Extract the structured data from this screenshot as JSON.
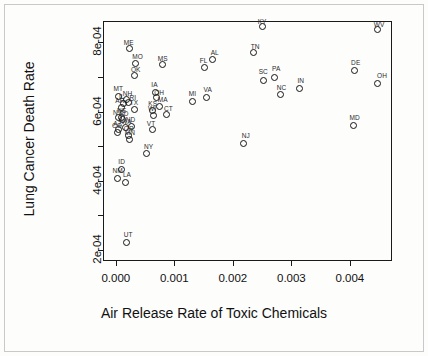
{
  "chart_data": {
    "type": "scatter",
    "title": "",
    "xlabel": "Air Release Rate of Toxic Chemicals",
    "ylabel": "Lung Cancer Death Rate",
    "xlim": [
      -0.00022,
      0.00472
    ],
    "ylim": [
      0.000168,
      0.000862
    ],
    "xticks": [
      0.0,
      0.001,
      0.002,
      0.003,
      0.004
    ],
    "xticklabels": [
      "0.000",
      "0.001",
      "0.002",
      "0.003",
      "0.004"
    ],
    "yticks": [
      0.0002,
      0.0004,
      0.0006,
      0.0008
    ],
    "yticklabels": [
      "2e-04",
      "4e-04",
      "6e-04",
      "8e-04"
    ],
    "grid": false,
    "legend": null,
    "marker": "open-circle",
    "point_label_field": "label",
    "points": [
      {
        "label": "KY",
        "x": 0.0025,
        "y": 0.000845,
        "lx": 0.0025,
        "ly": 0.000862
      },
      {
        "label": "WV",
        "x": 0.00447,
        "y": 0.000836,
        "lx": 0.0045,
        "ly": 0.000853
      },
      {
        "label": "ME",
        "x": 0.00024,
        "y": 0.000782,
        "lx": 0.00022,
        "ly": 0.0008
      },
      {
        "label": "TN",
        "x": 0.00236,
        "y": 0.000771,
        "lx": 0.00238,
        "ly": 0.000789
      },
      {
        "label": "AL",
        "x": 0.00166,
        "y": 0.000751,
        "lx": 0.00169,
        "ly": 0.000772
      },
      {
        "label": "MO",
        "x": 0.00034,
        "y": 0.00074,
        "lx": 0.00037,
        "ly": 0.000762
      },
      {
        "label": "MS",
        "x": 0.00079,
        "y": 0.000735,
        "lx": 0.0008,
        "ly": 0.000756
      },
      {
        "label": "FL",
        "x": 0.00152,
        "y": 0.000727,
        "lx": 0.0015,
        "ly": 0.000749
      },
      {
        "label": "DE",
        "x": 0.00408,
        "y": 0.00072,
        "lx": 0.0041,
        "ly": 0.000742
      },
      {
        "label": "OK",
        "x": 0.00031,
        "y": 0.000703,
        "lx": 0.00034,
        "ly": 0.000723
      },
      {
        "label": "PA",
        "x": 0.00272,
        "y": 0.0007,
        "lx": 0.00274,
        "ly": 0.000725
      },
      {
        "label": "SC",
        "x": 0.00253,
        "y": 0.00069,
        "lx": 0.00252,
        "ly": 0.000716
      },
      {
        "label": "OH",
        "x": 0.00448,
        "y": 0.000681,
        "lx": 0.00455,
        "ly": 0.000706
      },
      {
        "label": "IN",
        "x": 0.00314,
        "y": 0.000668,
        "lx": 0.00316,
        "ly": 0.000692
      },
      {
        "label": "IA",
        "x": 0.00067,
        "y": 0.000655,
        "lx": 0.00066,
        "ly": 0.00068
      },
      {
        "label": "NC",
        "x": 0.00282,
        "y": 0.000649,
        "lx": 0.00283,
        "ly": 0.000671
      },
      {
        "label": "MT",
        "x": 4e-05,
        "y": 0.000645,
        "lx": 4e-05,
        "ly": 0.000669
      },
      {
        "label": "VA",
        "x": 0.00155,
        "y": 0.000641,
        "lx": 0.00157,
        "ly": 0.000665
      },
      {
        "label": "OH2",
        "x": 0.0007,
        "y": 0.000641,
        "lx": 0.00074,
        "ly": 0.000657
      },
      {
        "label": "MI",
        "x": 0.00131,
        "y": 0.00063,
        "lx": 0.00131,
        "ly": 0.000654
      },
      {
        "label": "NH",
        "x": 0.00018,
        "y": 0.000634,
        "lx": 0.0002,
        "ly": 0.000654
      },
      {
        "label": "RI",
        "x": 0.00021,
        "y": 0.000625,
        "lx": 0.00029,
        "ly": 0.000643
      },
      {
        "label": "IL",
        "x": 0.00013,
        "y": 0.000623,
        "lx": 0.0001,
        "ly": 0.000644
      },
      {
        "label": "MA",
        "x": 0.00075,
        "y": 0.000614,
        "lx": 0.0008,
        "ly": 0.000637
      },
      {
        "label": "AR",
        "x": 0.0001,
        "y": 0.000613,
        "lx": 7e-05,
        "ly": 0.000634
      },
      {
        "label": "TX",
        "x": 0.00031,
        "y": 0.000607,
        "lx": 0.00031,
        "ly": 0.000628
      },
      {
        "label": "KS",
        "x": 0.00063,
        "y": 0.000604,
        "lx": 0.00063,
        "ly": 0.000625
      },
      {
        "label": "WI",
        "x": 0.00064,
        "y": 0.00059,
        "lx": 0.00062,
        "ly": 0.00061
      },
      {
        "label": "CT",
        "x": 0.00087,
        "y": 0.000591,
        "lx": 0.0009,
        "ly": 0.000611
      },
      {
        "label": "NE",
        "x": 9e-05,
        "y": 0.000584,
        "lx": 0.0001,
        "ly": 0.000604
      },
      {
        "label": "NV",
        "x": 5e-05,
        "y": 0.000582,
        "lx": 3e-05,
        "ly": 0.0006
      },
      {
        "label": "SD",
        "x": 0.00012,
        "y": 0.000576,
        "lx": 0.00014,
        "ly": 0.000597
      },
      {
        "label": "MD",
        "x": 0.00407,
        "y": 0.000561,
        "lx": 0.00408,
        "ly": 0.000585
      },
      {
        "label": "ND",
        "x": 0.00026,
        "y": 0.000558,
        "lx": 0.00025,
        "ly": 0.00058
      },
      {
        "label": "WA",
        "x": 0.00016,
        "y": 0.000553,
        "lx": 0.00018,
        "ly": 0.000574
      },
      {
        "label": "AZ",
        "x": 5e-05,
        "y": 0.000548,
        "lx": 3e-05,
        "ly": 0.000568
      },
      {
        "label": "VT",
        "x": 0.00062,
        "y": 0.000547,
        "lx": 0.0006,
        "ly": 0.000568
      },
      {
        "label": "CO",
        "x": 3e-05,
        "y": 0.000541,
        "lx": 2e-05,
        "ly": 0.000562
      },
      {
        "label": "OR",
        "x": 0.00021,
        "y": 0.000531,
        "lx": 0.00022,
        "ly": 0.000552
      },
      {
        "label": "MN",
        "x": 0.00023,
        "y": 0.000519,
        "lx": 0.00024,
        "ly": 0.00054
      },
      {
        "label": "NJ",
        "x": 0.00219,
        "y": 0.000509,
        "lx": 0.00222,
        "ly": 0.000533
      },
      {
        "label": "NY",
        "x": 0.00053,
        "y": 0.000478,
        "lx": 0.00056,
        "ly": 0.000501
      },
      {
        "label": "ID",
        "x": 9e-05,
        "y": 0.000434,
        "lx": 0.0001,
        "ly": 0.000458
      },
      {
        "label": "NM",
        "x": 2e-05,
        "y": 0.000408,
        "lx": 3e-05,
        "ly": 0.000431
      },
      {
        "label": "LA",
        "x": 0.00017,
        "y": 0.000395,
        "lx": 0.00019,
        "ly": 0.00042
      },
      {
        "label": "UT",
        "x": 0.00019,
        "y": 0.000222,
        "lx": 0.00021,
        "ly": 0.000246
      }
    ]
  },
  "axes": {
    "x_title": "Air Release Rate of Toxic Chemicals",
    "y_title": "Lung Cancer Death Rate"
  }
}
